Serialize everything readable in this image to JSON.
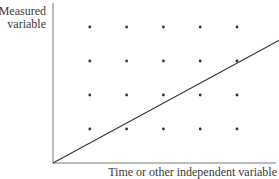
{
  "diagram": {
    "y_label_line1": "Measured",
    "y_label_line2": "variable",
    "x_label": "Time or other independent variable",
    "colors": {
      "axis": "#7a7a7a",
      "dot": "#333333",
      "line": "#333333",
      "text": "#3a3a3a"
    }
  },
  "chart_data": {
    "type": "scatter",
    "title": "",
    "xlabel": "Time or other independent variable",
    "ylabel": "Measured variable",
    "grid": false,
    "legend": null,
    "series": [
      {
        "name": "grid points",
        "kind": "scatter",
        "points": [
          [
            1,
            4
          ],
          [
            2,
            4
          ],
          [
            3,
            4
          ],
          [
            4,
            4
          ],
          [
            5,
            4
          ],
          [
            1,
            3
          ],
          [
            2,
            3
          ],
          [
            3,
            3
          ],
          [
            4,
            3
          ],
          [
            5,
            3
          ],
          [
            1,
            2
          ],
          [
            2,
            2
          ],
          [
            3,
            2
          ],
          [
            4,
            2
          ],
          [
            5,
            2
          ],
          [
            1,
            1
          ],
          [
            2,
            1
          ],
          [
            3,
            1
          ],
          [
            4,
            1
          ],
          [
            5,
            1
          ]
        ]
      },
      {
        "name": "trend line",
        "kind": "line",
        "points": [
          [
            0,
            0
          ],
          [
            6.3,
            3.7
          ]
        ]
      }
    ],
    "xlim": [
      0,
      6.3
    ],
    "ylim": [
      0,
      4.8
    ]
  }
}
